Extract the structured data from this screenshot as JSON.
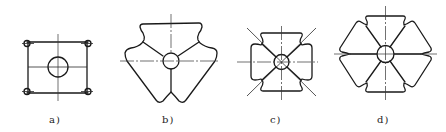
{
  "figure": {
    "colors": {
      "line": "#1a1a1a",
      "background": "#ffffff"
    },
    "panels": [
      {
        "id": "a",
        "label": "a)",
        "shape": "square plate with four corner bosses and central hole"
      },
      {
        "id": "b",
        "label": "b)",
        "shape": "three-lobed plate with central hole"
      },
      {
        "id": "c",
        "label": "c)",
        "shape": "four-lobed cross plate with central hole and diagonal lines"
      },
      {
        "id": "d",
        "label": "d)",
        "shape": "six-lobed hexagonal plate with central hole"
      }
    ]
  }
}
